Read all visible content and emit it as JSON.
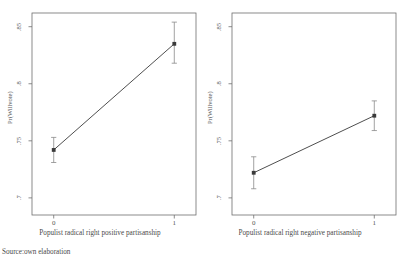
{
  "source_note": "Source:own elaboration",
  "chart_data": [
    {
      "type": "line",
      "panel": "left",
      "title": "",
      "xlabel": "Populist radical right positive partisanship",
      "ylabel": "Pr(Willvote)",
      "x": [
        0,
        1
      ],
      "xtick_labels": [
        "0",
        "1"
      ],
      "ytick_labels": [
        ".85",
        ".8",
        ".75",
        ".7"
      ],
      "ytick_values": [
        0.85,
        0.8,
        0.75,
        0.7
      ],
      "ylim": [
        0.685,
        0.862
      ],
      "xlim": [
        -0.18,
        1.18
      ],
      "grid": false,
      "legend": "none",
      "marker": "filled-square",
      "series": [
        {
          "name": "Pr(Willvote)",
          "values": [
            0.742,
            0.835
          ],
          "ci_low": [
            0.731,
            0.818
          ],
          "ci_high": [
            0.753,
            0.854
          ]
        }
      ]
    },
    {
      "type": "line",
      "panel": "right",
      "title": "",
      "xlabel": "Populist radical right negative partisanship",
      "ylabel": "Pr(Willvote)",
      "x": [
        0,
        1
      ],
      "xtick_labels": [
        "0",
        "1"
      ],
      "ytick_labels": [
        ".85",
        ".8",
        ".75",
        ".7"
      ],
      "ytick_values": [
        0.85,
        0.8,
        0.75,
        0.7
      ],
      "ylim": [
        0.685,
        0.862
      ],
      "xlim": [
        -0.18,
        1.18
      ],
      "grid": false,
      "legend": "none",
      "marker": "filled-square",
      "series": [
        {
          "name": "Pr(Willvote)",
          "values": [
            0.722,
            0.772
          ],
          "ci_low": [
            0.708,
            0.759
          ],
          "ci_high": [
            0.736,
            0.785
          ]
        }
      ]
    }
  ]
}
